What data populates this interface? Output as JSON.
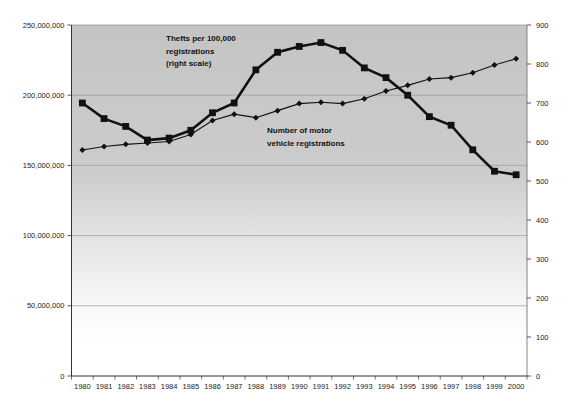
{
  "page": {
    "background": "#ffffff"
  },
  "chart_data": {
    "type": "line",
    "title": "",
    "x_categories": [
      "1980",
      "1981",
      "1982",
      "1983",
      "1984",
      "1985",
      "1986",
      "1987",
      "1988",
      "1989",
      "1990",
      "1991",
      "1992",
      "1993",
      "1994",
      "1995",
      "1996",
      "1997",
      "1998",
      "1999",
      "2000"
    ],
    "series": [
      {
        "name": "Thefts per 100,000 registrations (right scale)",
        "axis": "right",
        "marker": "square",
        "color": "#111111",
        "values": [
          700,
          660,
          640,
          605,
          610,
          630,
          675,
          700,
          785,
          830,
          845,
          855,
          835,
          790,
          765,
          720,
          665,
          643,
          580,
          525,
          516
        ]
      },
      {
        "name": "Number of motor vehicle registrations",
        "axis": "left",
        "marker": "diamond",
        "color": "#111111",
        "values": [
          161000000,
          163500000,
          165000000,
          166000000,
          167000000,
          172000000,
          182000000,
          186500000,
          184000000,
          189000000,
          194000000,
          195000000,
          194000000,
          197500000,
          203000000,
          207000000,
          211500000,
          212500000,
          216000000,
          221500000,
          226000000
        ]
      }
    ],
    "left_axis": {
      "min": 0,
      "max": 250000000,
      "tick_interval": 50000000,
      "tick_labels": [
        "250,000,000",
        "200,000,000",
        "150,000,000",
        "100,000,000",
        "50,000,000",
        "0"
      ]
    },
    "right_axis": {
      "min": 0,
      "max": 900,
      "tick_interval": 100,
      "tick_labels": [
        "900",
        "800",
        "700",
        "600",
        "500",
        "400",
        "300",
        "200",
        "100",
        "0"
      ]
    },
    "annotations": [
      {
        "lines": [
          "Thefts per 100,000",
          "registrations",
          "(right scale)"
        ]
      },
      {
        "lines": [
          "Number of motor",
          "vehicle registrations"
        ]
      }
    ],
    "grid": {
      "horizontal": true,
      "vertical": false
    },
    "legend_position": "none",
    "plot_background_gradient": [
      "#c4c4c4",
      "#ffffff"
    ],
    "gridline_color": "#9b9b9b",
    "axis_color": "#333333",
    "tick_label_color": "#222222"
  }
}
